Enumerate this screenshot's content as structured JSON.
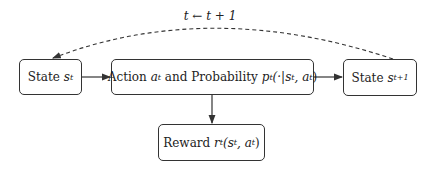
{
  "diagram": {
    "nodes": [
      {
        "id": "state_t",
        "prefix": "State ",
        "var": "s",
        "sub": "t"
      },
      {
        "id": "action",
        "prefix": "Action ",
        "var": "a",
        "sub": "t",
        "mid": " and Probability ",
        "var2": "p",
        "sub2": "t",
        "tail": "(·|s",
        "tail_sub": "t",
        "tail2": ", a",
        "tail2_sub": "t",
        "close": ")"
      },
      {
        "id": "state_t1",
        "prefix": "State ",
        "var": "s",
        "sub": "t+1"
      },
      {
        "id": "reward",
        "prefix": "Reward ",
        "var": "r",
        "sub": "t",
        "tail": "(s",
        "tail_sub": "t",
        "tail2": ", a",
        "tail2_sub": "t",
        "close": ")"
      }
    ],
    "edges": [
      {
        "from": "state_t",
        "to": "action",
        "style": "solid"
      },
      {
        "from": "action",
        "to": "state_t1",
        "style": "solid"
      },
      {
        "from": "action",
        "to": "reward",
        "style": "solid"
      },
      {
        "from": "state_t1",
        "to": "state_t",
        "style": "dashed",
        "label": "t ← t + 1"
      }
    ],
    "loop_label": "t ← t + 1"
  }
}
